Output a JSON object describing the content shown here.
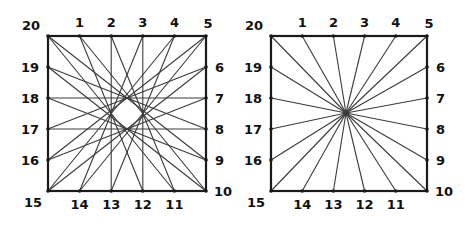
{
  "diagram": {
    "point_labels": [
      "20",
      "1",
      "2",
      "3",
      "4",
      "5",
      "6",
      "7",
      "8",
      "9",
      "10",
      "11",
      "12",
      "13",
      "14",
      "15",
      "16",
      "17",
      "18",
      "19"
    ],
    "panels": [
      {
        "name": "chord-pattern-square",
        "square": {
          "x0": 48,
          "y0": 36,
          "x1": 206,
          "y1": 191
        },
        "connection_rule": "each point i joined to point i+9 (mod 20)",
        "offset": 9,
        "center_point": null
      },
      {
        "name": "radial-star-square",
        "square": {
          "x0": 271,
          "y0": 36,
          "x1": 427,
          "y1": 191
        },
        "connection_rule": "every point joined to a common interior point",
        "offset": null,
        "center_point": {
          "x": 346,
          "y": 113
        }
      }
    ],
    "colors": {
      "frame": "#1a1a1a",
      "line": "#3a3a3a",
      "label": "#111111",
      "background": "#ffffff"
    }
  }
}
